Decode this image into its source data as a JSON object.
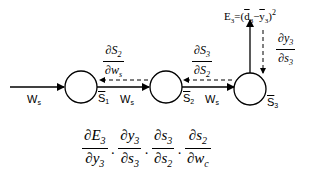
{
  "diagram": {
    "type": "neural-chain-backprop",
    "nodes": [
      {
        "id": "n1",
        "label_base": "S",
        "label_sub": "1",
        "overline": true
      },
      {
        "id": "n2",
        "label_base": "S",
        "label_sub": "2",
        "overline": true
      },
      {
        "id": "n3",
        "label_base": "S",
        "label_sub": "3",
        "overline": true
      }
    ],
    "forward_edges": [
      {
        "from": "input",
        "to": "n1",
        "label_base": "W",
        "label_sub": "s"
      },
      {
        "from": "n1",
        "to": "n2",
        "label_base": "W",
        "label_sub": "s"
      },
      {
        "from": "n2",
        "to": "n3",
        "label_base": "W",
        "label_sub": "s"
      }
    ],
    "output": {
      "error_label": "E",
      "error_sub": "3",
      "equals": "=",
      "expr_open": "(",
      "d_base": "d",
      "d_sub": "3",
      "minus": "−",
      "y_base": "y",
      "y_sub": "3",
      "expr_close": ")",
      "power": "2"
    },
    "backward_gradients": [
      {
        "position": "between-n1-n2",
        "num": "∂S",
        "num_sub": "2",
        "den": "∂w",
        "den_sub": "s"
      },
      {
        "position": "between-n2-n3",
        "num": "∂S",
        "num_sub": "3",
        "den": "∂S",
        "den_sub": "2"
      },
      {
        "position": "output-to-n3",
        "num": "∂y",
        "num_sub": "3",
        "den": "∂s",
        "den_sub": "3"
      }
    ],
    "chain_rule_formula": [
      {
        "num": "∂E",
        "num_sub": "3",
        "den": "∂y",
        "den_sub": "3"
      },
      {
        "num": "∂y",
        "num_sub": "3",
        "den": "∂s",
        "den_sub": "3"
      },
      {
        "num": "∂s",
        "num_sub": "3",
        "den": "∂s",
        "den_sub": "2"
      },
      {
        "num": "∂s",
        "num_sub": "2",
        "den": "∂w",
        "den_sub": "c"
      }
    ],
    "dot_operator": "·"
  }
}
